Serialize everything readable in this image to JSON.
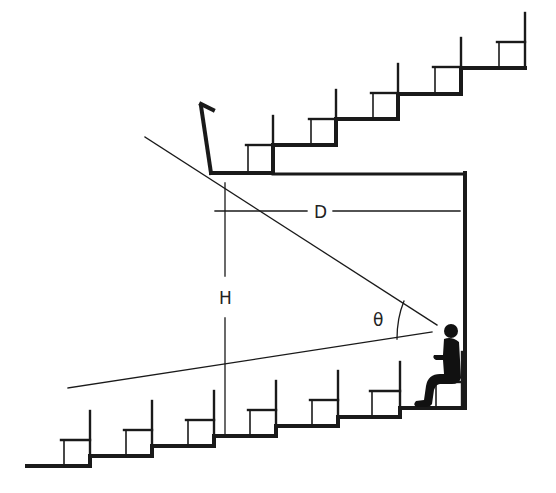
{
  "diagram": {
    "labels": {
      "distance": "D",
      "height": "H",
      "angle": "θ"
    },
    "colors": {
      "stroke": "#1a1a1a",
      "background": "#ffffff"
    },
    "elements": {
      "lower_tier_steps": 7,
      "upper_balcony_steps": 5,
      "seated_viewer": 1
    }
  }
}
